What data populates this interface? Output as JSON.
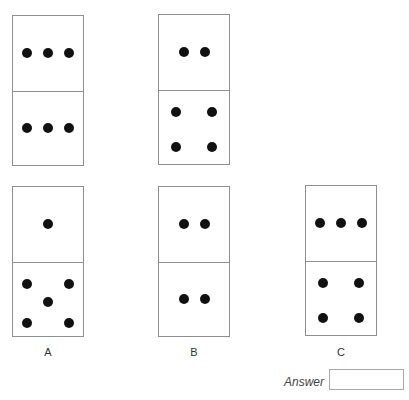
{
  "puzzle": {
    "sequence": [
      {
        "id": "seq-1",
        "top_pips": 3,
        "bottom_pips": 3,
        "x": 12,
        "y": 15
      },
      {
        "id": "seq-2",
        "top_pips": 2,
        "bottom_pips": 4,
        "x": 158,
        "y": 14
      }
    ],
    "options": [
      {
        "label": "A",
        "top_pips": 1,
        "bottom_pips": 5,
        "x": 12,
        "y": 186
      },
      {
        "label": "B",
        "top_pips": 2,
        "bottom_pips": 2,
        "x": 158,
        "y": 186
      },
      {
        "label": "C",
        "top_pips": 3,
        "bottom_pips": 4,
        "x": 305,
        "y": 185
      }
    ]
  },
  "answer": {
    "label": "Answer",
    "value": ""
  }
}
